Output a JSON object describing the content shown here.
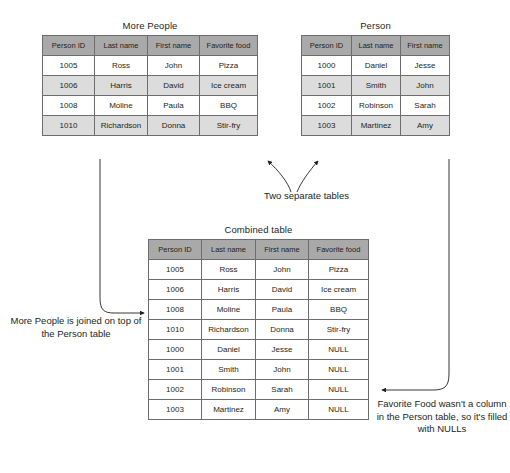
{
  "diagram": {
    "columns_full": [
      "Person ID",
      "Last name",
      "First name",
      "Favorite food"
    ],
    "columns_person": [
      "Person ID",
      "Last name",
      "First name"
    ]
  },
  "more_people": {
    "title": "More People",
    "headers": [
      "Person ID",
      "Last name",
      "First name",
      "Favorite food"
    ],
    "rows": [
      [
        "1005",
        "Ross",
        "John",
        "Pizza"
      ],
      [
        "1006",
        "Harris",
        "David",
        "Ice cream"
      ],
      [
        "1008",
        "Moline",
        "Paula",
        "BBQ"
      ],
      [
        "1010",
        "Richardson",
        "Donna",
        "Stir-fry"
      ]
    ]
  },
  "person": {
    "title": "Person",
    "headers": [
      "Person ID",
      "Last name",
      "First name"
    ],
    "rows": [
      [
        "1000",
        "Daniel",
        "Jesse"
      ],
      [
        "1001",
        "Smith",
        "John"
      ],
      [
        "1002",
        "Robinson",
        "Sarah"
      ],
      [
        "1003",
        "Martinez",
        "Amy"
      ]
    ]
  },
  "combined": {
    "title": "Combined table",
    "headers": [
      "Person ID",
      "Last name",
      "First name",
      "Favorite food"
    ],
    "rows": [
      [
        "1005",
        "Ross",
        "John",
        "Pizza"
      ],
      [
        "1006",
        "Harris",
        "David",
        "Ice cream"
      ],
      [
        "1008",
        "Moline",
        "Paula",
        "BBQ"
      ],
      [
        "1010",
        "Richardson",
        "Donna",
        "Stir-fry"
      ],
      [
        "1000",
        "Daniel",
        "Jesse",
        "NULL"
      ],
      [
        "1001",
        "Smith",
        "John",
        "NULL"
      ],
      [
        "1002",
        "Robinson",
        "Sarah",
        "NULL"
      ],
      [
        "1003",
        "Martinez",
        "Amy",
        "NULL"
      ]
    ]
  },
  "annotations": {
    "two_separate_tables": "Two separate tables",
    "left_note": "More People is joined on top of the Person table",
    "right_note": "Favorite Food wasn't a column in the Person table, so it's filled with NULLs"
  },
  "colors": {
    "header_fill": "#a9a9a9",
    "row_shade": "#dcdcdc",
    "row_plain": "#ffffff",
    "border": "#6d6d6d",
    "text": "#231f20"
  }
}
